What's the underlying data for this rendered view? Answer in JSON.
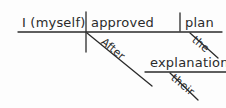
{
  "diagram": {
    "type": "reed-kellogg-sentence-diagram",
    "ink_color": "#2b2b2b",
    "background_color": "#fdfdfd",
    "sentence": "After their explanation I (myself) approved the plan.",
    "nodes": {
      "subject": {
        "text": "I (myself)",
        "role": "subject"
      },
      "verb": {
        "text": "approved",
        "role": "verb"
      },
      "direct_object": {
        "text": "plan",
        "role": "direct-object"
      },
      "preposition": {
        "text": "After",
        "role": "preposition"
      },
      "prep_object": {
        "text": "explanation",
        "role": "object-of-preposition"
      },
      "article": {
        "text": "the",
        "role": "article-modifier"
      },
      "possessive": {
        "text": "their",
        "role": "possessive-modifier"
      }
    },
    "strokes": {
      "baseline": {
        "x1": 18,
        "y1": 32,
        "x2": 222,
        "y2": 32
      },
      "subject_verb_divider": {
        "x1": 86,
        "y1": 12,
        "x2": 86,
        "y2": 52
      },
      "verb_object_divider": {
        "x1": 180,
        "y1": 13,
        "x2": 180,
        "y2": 31
      },
      "prepositional_slant": {
        "x1": 87,
        "y1": 33,
        "x2": 152,
        "y2": 86
      },
      "prep_object_line": {
        "x1": 145,
        "y1": 72,
        "x2": 226,
        "y2": 72
      },
      "article_slant": {
        "x1": 190,
        "y1": 33,
        "x2": 218,
        "y2": 58
      },
      "possessive_slant": {
        "x1": 170,
        "y1": 73,
        "x2": 198,
        "y2": 100
      }
    }
  }
}
